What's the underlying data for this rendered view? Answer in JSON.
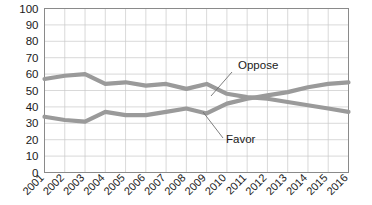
{
  "chart_data": {
    "type": "line",
    "title": "",
    "xlabel": "",
    "ylabel": "",
    "ylim": [
      0,
      100
    ],
    "ytick_step": 10,
    "grid": true,
    "legend_position": "inline-annotations",
    "categories": [
      "2001",
      "2002",
      "2003",
      "2004",
      "2005",
      "2006",
      "2007",
      "2008",
      "2009",
      "2010",
      "2011",
      "2012",
      "2013",
      "2014",
      "2015",
      "2016"
    ],
    "yticks": [
      "0",
      "10",
      "20",
      "30",
      "40",
      "50",
      "60",
      "70",
      "80",
      "90",
      "100"
    ],
    "series": [
      {
        "name": "Oppose",
        "color": "#9a9a9a",
        "values": [
          57,
          59,
          60,
          54,
          55,
          53,
          54,
          51,
          54,
          48,
          46,
          45,
          43,
          41,
          39,
          37
        ]
      },
      {
        "name": "Favor",
        "color": "#9a9a9a",
        "values": [
          34,
          32,
          31,
          37,
          35,
          35,
          37,
          39,
          36,
          42,
          45,
          47,
          49,
          52,
          54,
          55
        ]
      }
    ],
    "annotations": [
      {
        "text": "Oppose",
        "series": "Oppose",
        "label_x": 238,
        "label_y": 69,
        "leader_from_x": 232,
        "leader_from_y": 72,
        "leader_to_x": 211,
        "leader_to_y": 96
      },
      {
        "text": "Favor",
        "series": "Favor",
        "label_x": 226,
        "label_y": 143,
        "leader_from_x": 223,
        "leader_from_y": 138,
        "leader_to_x": 203,
        "leader_to_y": 112
      }
    ]
  },
  "axis_colors": {
    "gridline": "#c9c9c9",
    "frame": "#8a8a8a",
    "text": "#1a1a1a"
  }
}
